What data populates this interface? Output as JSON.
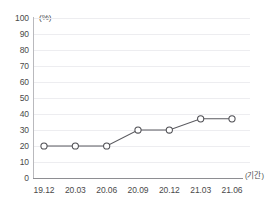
{
  "chart_data": {
    "type": "line",
    "title": "",
    "subtitle": "",
    "xlabel": "(기간)",
    "ylabel": "(%)",
    "unit_label": "(%)",
    "categories": [
      "19.12",
      "20.03",
      "20.06",
      "20.09",
      "20.12",
      "21.03",
      "21.06"
    ],
    "values": [
      20,
      20,
      20,
      30,
      30,
      37,
      37
    ],
    "series": [
      {
        "name": "",
        "values": [
          20,
          20,
          20,
          30,
          30,
          37,
          37
        ]
      }
    ],
    "ylim": [
      0,
      100
    ],
    "ytick_labels": [
      "100",
      "90",
      "80",
      "70",
      "60",
      "50",
      "40",
      "30",
      "20",
      "10",
      "0"
    ],
    "ytick_values": [
      100,
      90,
      80,
      70,
      60,
      50,
      40,
      30,
      20,
      10,
      0
    ],
    "grid": true,
    "legend": false,
    "legend_position": "none",
    "marker": "open-circle",
    "line_color": "#5b5b60",
    "marker_fill": "#ffffff",
    "marker_stroke": "#4e4e53",
    "gridline_color": "#ededf0",
    "axis_color": "#8e8e92",
    "background_color": "#ffffff"
  }
}
